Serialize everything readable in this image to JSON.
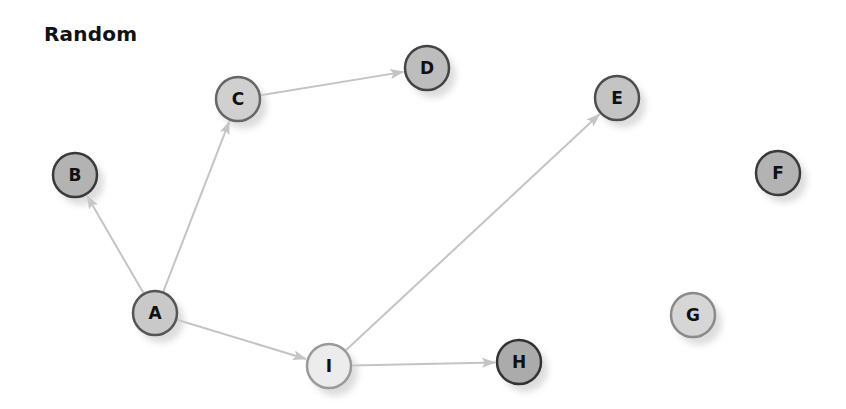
{
  "title": "Random",
  "graph": {
    "edge_color": "#c4c4c4",
    "node_radius": 23,
    "nodes": [
      {
        "id": "A",
        "label": "A",
        "x": 155,
        "y": 313,
        "fill": "#c9c9c9",
        "stroke": "#555555"
      },
      {
        "id": "B",
        "label": "B",
        "x": 75,
        "y": 175,
        "fill": "#b3b3b3",
        "stroke": "#3a3a3a"
      },
      {
        "id": "C",
        "label": "C",
        "x": 238,
        "y": 99,
        "fill": "#d0d0d0",
        "stroke": "#666666"
      },
      {
        "id": "D",
        "label": "D",
        "x": 427,
        "y": 68,
        "fill": "#bdbdbd",
        "stroke": "#444444"
      },
      {
        "id": "E",
        "label": "E",
        "x": 617,
        "y": 98,
        "fill": "#c4c4c4",
        "stroke": "#4d4d4d"
      },
      {
        "id": "F",
        "label": "F",
        "x": 778,
        "y": 173,
        "fill": "#b3b3b3",
        "stroke": "#3a3a3a"
      },
      {
        "id": "G",
        "label": "G",
        "x": 693,
        "y": 315,
        "fill": "#d6d6d6",
        "stroke": "#8a8a8a"
      },
      {
        "id": "H",
        "label": "H",
        "x": 519,
        "y": 362,
        "fill": "#ababab",
        "stroke": "#333333"
      },
      {
        "id": "I",
        "label": "I",
        "x": 329,
        "y": 366,
        "fill": "#ececec",
        "stroke": "#9a9a9a"
      }
    ],
    "edges": [
      {
        "from": "A",
        "to": "B"
      },
      {
        "from": "A",
        "to": "C"
      },
      {
        "from": "C",
        "to": "D"
      },
      {
        "from": "A",
        "to": "I"
      },
      {
        "from": "I",
        "to": "E"
      },
      {
        "from": "I",
        "to": "H"
      }
    ]
  }
}
